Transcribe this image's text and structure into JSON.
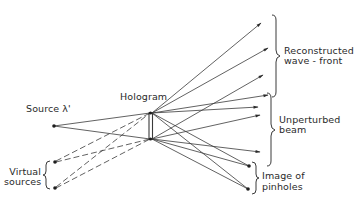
{
  "diagram": {
    "labels": {
      "source": "Source λ'",
      "hologram": "Hologram",
      "virtual_sources_line1": "Virtual",
      "virtual_sources_line2": "sources",
      "reconstructed_line1": "Reconstructed",
      "reconstructed_line2": "wave - front",
      "unperturbed_line1": "Unperturbed",
      "unperturbed_line2": "beam",
      "pinholes_line1": "Image of",
      "pinholes_line2": "pinholes"
    },
    "nodes": {
      "source": {
        "x": 54,
        "y": 126
      },
      "hologram_top": {
        "x": 151,
        "y": 113
      },
      "hologram_bottom": {
        "x": 151,
        "y": 139
      },
      "virtual_source_1": {
        "x": 54,
        "y": 162
      },
      "virtual_source_2": {
        "x": 54,
        "y": 188
      },
      "pinhole_image_1": {
        "x": 249,
        "y": 166
      },
      "pinhole_image_2": {
        "x": 248,
        "y": 189
      }
    },
    "line_color": "#3a3a3a"
  }
}
